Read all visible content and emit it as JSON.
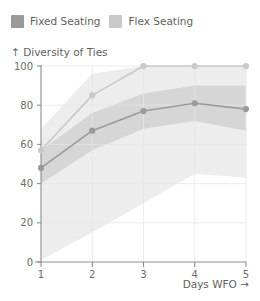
{
  "legend": {
    "items": [
      {
        "label": "Fixed Seating",
        "color": "#9a9a9a",
        "name": "fixed-seating"
      },
      {
        "label": "Flex Seating",
        "color": "#c9c9c9",
        "name": "flex-seating"
      }
    ]
  },
  "axes": {
    "y_axis_label": "↑ Diversity of Ties",
    "x_axis_label": "Days WFO →",
    "y_ticks": [
      "0",
      "20",
      "40",
      "60",
      "80",
      "100"
    ],
    "x_ticks": [
      "1",
      "2",
      "3",
      "4",
      "5"
    ]
  },
  "chart_data": {
    "type": "line",
    "title": "",
    "subtitle": "",
    "xlabel": "Days WFO →",
    "ylabel": "↑ Diversity of Ties",
    "x": [
      1,
      2,
      3,
      4,
      5
    ],
    "xlim": [
      1,
      5
    ],
    "ylim": [
      0,
      100
    ],
    "yticks": [
      0,
      20,
      40,
      60,
      80,
      100
    ],
    "xticks": [
      1,
      2,
      3,
      4,
      5
    ],
    "grid": "vertical-and-horizontal-faint",
    "legend_position": "top-left-above-plot",
    "series": [
      {
        "name": "Fixed Seating",
        "color": "#9a9a9a",
        "values": [
          48,
          67,
          77,
          81,
          78
        ],
        "band_upper": [
          57,
          76,
          86,
          90,
          90
        ],
        "band_lower": [
          40,
          57,
          68,
          72,
          67
        ],
        "band_color": "#d6d6d6"
      },
      {
        "name": "Flex Seating",
        "color": "#c9c9c9",
        "values": [
          57,
          85,
          100,
          100,
          100
        ],
        "band_upper": [
          68,
          96,
          100,
          100,
          100
        ],
        "band_lower": [
          1,
          15,
          30,
          45,
          43
        ],
        "band_color": "#ededed"
      }
    ]
  }
}
